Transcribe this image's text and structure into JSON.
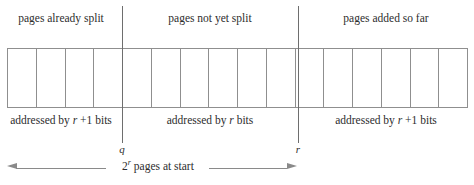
{
  "figure": {
    "type": "diagram",
    "total_cells": 16,
    "strip": {
      "cells": [
        {
          "index": 1,
          "region": "already-split"
        },
        {
          "index": 2,
          "region": "already-split"
        },
        {
          "index": 3,
          "region": "already-split"
        },
        {
          "index": 4,
          "region": "already-split"
        },
        {
          "index": 5,
          "region": "not-yet-split"
        },
        {
          "index": 6,
          "region": "not-yet-split"
        },
        {
          "index": 7,
          "region": "not-yet-split"
        },
        {
          "index": 8,
          "region": "not-yet-split"
        },
        {
          "index": 9,
          "region": "not-yet-split"
        },
        {
          "index": 10,
          "region": "not-yet-split"
        },
        {
          "index": 11,
          "region": "added-so-far"
        },
        {
          "index": 12,
          "region": "added-so-far"
        },
        {
          "index": 13,
          "region": "added-so-far"
        },
        {
          "index": 14,
          "region": "added-so-far"
        },
        {
          "index": 15,
          "region": "added-so-far"
        },
        {
          "index": 16,
          "region": "added-so-far"
        }
      ]
    },
    "top_labels": [
      {
        "id": "already-split",
        "text": "pages already split"
      },
      {
        "id": "not-yet-split",
        "text": "pages not yet split"
      },
      {
        "id": "added-so-far",
        "text": "pages added so far"
      }
    ],
    "bottom_labels": [
      {
        "id": "addr-left",
        "prefix": "addressed by ",
        "symbol": "r",
        "suffix": " +1 bits"
      },
      {
        "id": "addr-middle",
        "prefix": "addressed by ",
        "symbol": "r",
        "suffix": " bits"
      },
      {
        "id": "addr-right",
        "prefix": "addressed by ",
        "symbol": "r",
        "suffix": " +1 bits"
      }
    ],
    "markers": [
      {
        "id": "q-marker",
        "label": "q"
      },
      {
        "id": "r-marker",
        "label": "r"
      }
    ],
    "dimension": {
      "base": "2",
      "exponent": "r",
      "text": " pages at start",
      "full_text": "2^r pages at start"
    },
    "colors": {
      "line": "#8f8f8f",
      "divider": "#6e6e6e",
      "text": "#2d2d2d",
      "background": "#ffffff"
    }
  }
}
